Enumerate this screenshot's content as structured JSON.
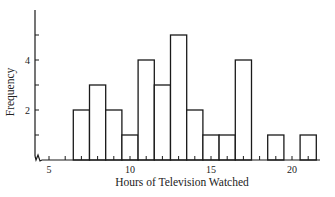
{
  "chart_data": {
    "type": "bar",
    "subtype": "histogram",
    "title": "",
    "xlabel": "Hours of Television Watched",
    "ylabel": "Frequency",
    "x_ticks_labeled": [
      5,
      10,
      15,
      20
    ],
    "y_ticks_labeled": [
      2,
      4
    ],
    "y_ticks": [
      1,
      2,
      3,
      4,
      5
    ],
    "xlim": [
      4,
      22
    ],
    "ylim": [
      0,
      5.9
    ],
    "axis_break_on_x": true,
    "bin_width": 1,
    "bins": [
      {
        "start": 6.5,
        "end": 7.5,
        "value": 2
      },
      {
        "start": 7.5,
        "end": 8.5,
        "value": 3
      },
      {
        "start": 8.5,
        "end": 9.5,
        "value": 2
      },
      {
        "start": 9.5,
        "end": 10.5,
        "value": 1
      },
      {
        "start": 10.5,
        "end": 11.5,
        "value": 4
      },
      {
        "start": 11.5,
        "end": 12.5,
        "value": 3
      },
      {
        "start": 12.5,
        "end": 13.5,
        "value": 5
      },
      {
        "start": 13.5,
        "end": 14.5,
        "value": 2
      },
      {
        "start": 14.5,
        "end": 15.5,
        "value": 1
      },
      {
        "start": 15.5,
        "end": 16.5,
        "value": 1
      },
      {
        "start": 16.5,
        "end": 17.5,
        "value": 4
      },
      {
        "start": 17.5,
        "end": 18.5,
        "value": 0
      },
      {
        "start": 18.5,
        "end": 19.5,
        "value": 1
      },
      {
        "start": 19.5,
        "end": 20.5,
        "value": 0
      },
      {
        "start": 20.5,
        "end": 21.5,
        "value": 1
      }
    ],
    "categories": [
      "7",
      "8",
      "9",
      "10",
      "11",
      "12",
      "13",
      "14",
      "15",
      "16",
      "17",
      "18",
      "19",
      "20",
      "21"
    ],
    "values": [
      2,
      3,
      2,
      1,
      4,
      3,
      5,
      2,
      1,
      1,
      4,
      0,
      1,
      0,
      1
    ],
    "grid": false,
    "legend": null
  },
  "labels": {
    "x_axis": "Hours of Television Watched",
    "y_axis": "Frequency"
  }
}
